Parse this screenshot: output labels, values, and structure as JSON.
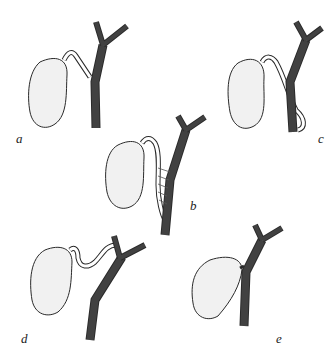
{
  "figure": {
    "panels": [
      {
        "id": "a",
        "label": "a"
      },
      {
        "id": "b",
        "label": "b"
      },
      {
        "id": "c",
        "label": "c"
      },
      {
        "id": "d",
        "label": "d"
      },
      {
        "id": "e",
        "label": "e"
      }
    ]
  },
  "colors": {
    "ink": "#2a2a2a",
    "hatch": "#8a8a8a",
    "background": "#ffffff"
  }
}
